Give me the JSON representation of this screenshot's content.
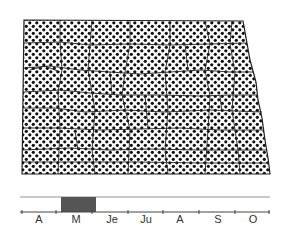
{
  "map": {
    "region": "North Dakota",
    "fill_pattern": "dots",
    "fill_color": "#111111",
    "boundary_color": "#222222"
  },
  "timeline": {
    "months": [
      {
        "label": "A",
        "x": 39
      },
      {
        "label": "M",
        "x": 76
      },
      {
        "label": "Je",
        "x": 112
      },
      {
        "label": "Ju",
        "x": 146
      },
      {
        "label": "A",
        "x": 180
      },
      {
        "label": "S",
        "x": 218
      },
      {
        "label": "O",
        "x": 253
      }
    ],
    "highlight": {
      "start_month": "M",
      "x_start": 61,
      "x_end": 96,
      "color": "#555555"
    }
  }
}
